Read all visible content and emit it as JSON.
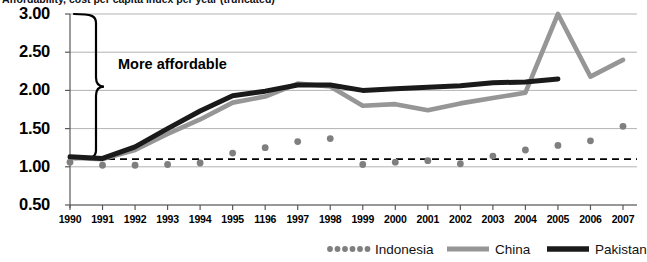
{
  "title": {
    "text": "Affordability, cost per capita index per year (truncated)"
  },
  "annotations": {
    "brace_label": "More affordable"
  },
  "colors": {
    "indonesia": "#7f7f7f",
    "china": "#969696",
    "pakistan": "#1a1a1a",
    "gridline": "#b3b3b3",
    "axis": "#595959",
    "reference_line": "#000000"
  },
  "legend": [
    {
      "name": "indonesia",
      "label": "Indonesia",
      "style": "dotted",
      "color": "#7f7f7f"
    },
    {
      "name": "china",
      "label": "China",
      "style": "solid",
      "color": "#969696"
    },
    {
      "name": "pakistan",
      "label": "Pakistan",
      "style": "solid",
      "color": "#1a1a1a"
    }
  ],
  "chart_data": {
    "type": "line",
    "title": "Affordability, cost per capita index per year (truncated)",
    "xlabel": "",
    "ylabel": "",
    "ylim": [
      0.5,
      3.0
    ],
    "yticks": [
      "0.50",
      "1.00",
      "1.50",
      "2.00",
      "2.50",
      "3.00"
    ],
    "ytick_values": [
      0.5,
      1.0,
      1.5,
      2.0,
      2.5,
      3.0
    ],
    "grid": true,
    "legend_position": "bottom",
    "x": [
      1990,
      1991,
      1992,
      1993,
      1994,
      1996,
      1996,
      1997,
      1998,
      1999,
      2000,
      2001,
      2002,
      2003,
      2004,
      2005,
      2006,
      2007
    ],
    "xtick_labels": [
      "1990",
      "1991",
      "1992",
      "1993",
      "1994",
      "1995",
      "1196",
      "1997",
      "1998",
      "1999",
      "2000",
      "2001",
      "2002",
      "2003",
      "2004",
      "2005",
      "2006",
      "2007"
    ],
    "reference_line": {
      "value": 1.1,
      "style": "dashed",
      "label": ""
    },
    "annotations": [
      {
        "type": "brace",
        "text": "More affordable",
        "from": 1.1,
        "to": 3.0
      }
    ],
    "series": [
      {
        "name": "Indonesia",
        "style": "dotted",
        "color": "#7f7f7f",
        "values": [
          1.06,
          1.02,
          1.02,
          1.03,
          1.05,
          1.18,
          1.25,
          1.33,
          1.37,
          1.03,
          1.06,
          1.08,
          1.04,
          1.14,
          1.22,
          1.28,
          1.34,
          1.53
        ]
      },
      {
        "name": "China",
        "style": "solid",
        "color": "#969696",
        "values": [
          1.12,
          1.1,
          1.22,
          1.43,
          1.62,
          1.84,
          1.92,
          2.09,
          2.05,
          1.8,
          1.82,
          1.74,
          1.83,
          1.9,
          1.97,
          3.0,
          2.18,
          2.4
        ]
      },
      {
        "name": "Pakistan",
        "style": "solid",
        "color": "#1a1a1a",
        "values": [
          1.13,
          1.11,
          1.26,
          1.5,
          1.73,
          1.93,
          1.99,
          2.07,
          2.07,
          2.0,
          2.02,
          2.04,
          2.06,
          2.1,
          2.11,
          2.15,
          null,
          null
        ]
      }
    ]
  }
}
